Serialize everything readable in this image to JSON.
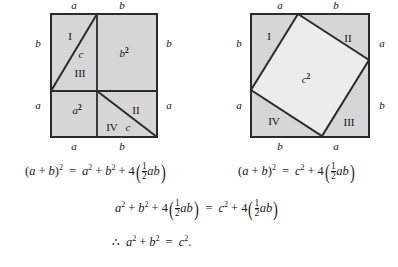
{
  "figure": {
    "caption_type": "geometric-proof-pythagorean-theorem",
    "colors": {
      "region_fill": "#d6d6d6",
      "inner_square_fill": "#ececec",
      "stroke": "#2b2b2b",
      "text": "#141414",
      "background": "#ffffff"
    },
    "left_diagram": {
      "name": "dissection-square-a-plus-b",
      "top_labels": [
        "a",
        "b"
      ],
      "left_labels": [
        "b",
        "a"
      ],
      "right_labels": [
        "b",
        "a"
      ],
      "bottom_labels": [
        "a",
        "b"
      ],
      "regions": [
        {
          "id": "I",
          "label": "I"
        },
        {
          "id": "III",
          "label": "III"
        },
        {
          "id": "II",
          "label": "II"
        },
        {
          "id": "IV",
          "label": "IV"
        }
      ],
      "area_labels": [
        {
          "base": "b",
          "exp": "2"
        },
        {
          "base": "a",
          "exp": "2"
        }
      ],
      "hypotenuse_labels": [
        "c",
        "c"
      ]
    },
    "right_diagram": {
      "name": "tilted-square-c-squared",
      "top_labels": [
        "a",
        "b"
      ],
      "left_labels": [
        "b",
        "a"
      ],
      "right_labels": [
        "a",
        "b"
      ],
      "bottom_labels": [
        "b",
        "a"
      ],
      "regions": [
        {
          "id": "I",
          "label": "I"
        },
        {
          "id": "II",
          "label": "II"
        },
        {
          "id": "III",
          "label": "III"
        },
        {
          "id": "IV",
          "label": "IV"
        }
      ],
      "area_label": {
        "base": "c",
        "exp": "2"
      }
    }
  },
  "equations": {
    "line1_left": {
      "lhs_open": "(",
      "lhs_a": "a",
      "plus1": "+",
      "lhs_b": "b",
      "lhs_close": ")",
      "lhs_exp": "2",
      "equals": "=",
      "t1": "a",
      "t1_exp": "2",
      "plus2": "+",
      "t2": "b",
      "t2_exp": "2",
      "plus3": "+",
      "coef": "4",
      "frac_num": "1",
      "frac_den": "2",
      "prod": "ab",
      "text": "(a + b)^2 = a^2 + b^2 + 4(1/2 ab)"
    },
    "line1_right": {
      "lhs_open": "(",
      "lhs_a": "a",
      "plus1": "+",
      "lhs_b": "b",
      "lhs_close": ")",
      "lhs_exp": "2",
      "equals": "=",
      "t1": "c",
      "t1_exp": "2",
      "plus3": "+",
      "coef": "4",
      "frac_num": "1",
      "frac_den": "2",
      "prod": "ab",
      "text": "(a + b)^2 = c^2 + 4(1/2 ab)"
    },
    "line2": {
      "t1": "a",
      "t1_exp": "2",
      "plus1": "+",
      "t2": "b",
      "t2_exp": "2",
      "plus2": "+",
      "coef1": "4",
      "frac1_num": "1",
      "frac1_den": "2",
      "prod1": "ab",
      "equals": "=",
      "t3": "c",
      "t3_exp": "2",
      "plus3": "+",
      "coef2": "4",
      "frac2_num": "1",
      "frac2_den": "2",
      "prod2": "ab",
      "text": "a^2 + b^2 + 4(1/2 ab) = c^2 + 4(1/2 ab)"
    },
    "line3": {
      "therefore": "∴",
      "t1": "a",
      "t1_exp": "2",
      "plus1": "+",
      "t2": "b",
      "t2_exp": "2",
      "equals": "=",
      "t3": "c",
      "t3_exp": "2",
      "period": ".",
      "text": "∴ a^2 + b^2 = c^2."
    }
  }
}
